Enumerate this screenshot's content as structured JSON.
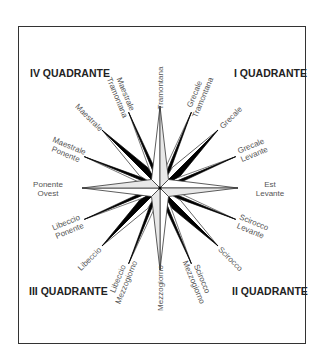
{
  "quadrants": {
    "q1": "I QUADRANTE",
    "q2": "II QUADRANTE",
    "q3": "III QUADRANTE",
    "q4": "IV QUADRANTE"
  },
  "winds": [
    {
      "angle": 0,
      "lines": [
        "Tramontana"
      ]
    },
    {
      "angle": 22.5,
      "lines": [
        "Grecale",
        "Tramontana"
      ]
    },
    {
      "angle": 45,
      "lines": [
        "Grecale"
      ]
    },
    {
      "angle": 67.5,
      "lines": [
        "Grecale",
        "Levante"
      ]
    },
    {
      "angle": 90,
      "lines": [
        "Est",
        "Levante"
      ]
    },
    {
      "angle": 112.5,
      "lines": [
        "Scirocco",
        "Levante"
      ]
    },
    {
      "angle": 135,
      "lines": [
        "Scirocco"
      ]
    },
    {
      "angle": 157.5,
      "lines": [
        "Scirocco",
        "Mezzogiorno"
      ]
    },
    {
      "angle": 180,
      "lines": [
        "Mezzogiorno"
      ]
    },
    {
      "angle": 202.5,
      "lines": [
        "Libeccio",
        "Mezzogiorno"
      ]
    },
    {
      "angle": 225,
      "lines": [
        "Libeccio"
      ]
    },
    {
      "angle": 247.5,
      "lines": [
        "Libeccio",
        "Ponente"
      ]
    },
    {
      "angle": 270,
      "lines": [
        "Ponente",
        "Ovest"
      ]
    },
    {
      "angle": 292.5,
      "lines": [
        "Maestrale",
        "Ponente"
      ]
    },
    {
      "angle": 315,
      "lines": [
        "Maestrale"
      ]
    },
    {
      "angle": 337.5,
      "lines": [
        "Maestrale",
        "Tramontana"
      ]
    }
  ]
}
